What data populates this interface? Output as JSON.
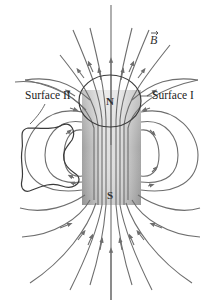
{
  "figure": {
    "labels": {
      "surface_1": "Surface I",
      "surface_2": "Surface II",
      "north_pole": "N",
      "south_pole": "S",
      "field_vector": "B"
    },
    "colors": {
      "field_line": "#6e6e6e",
      "surface_outline": "#3a3a3a",
      "magnet_dark": "#9a9a9a",
      "magnet_light": "#e6e6e6"
    }
  }
}
